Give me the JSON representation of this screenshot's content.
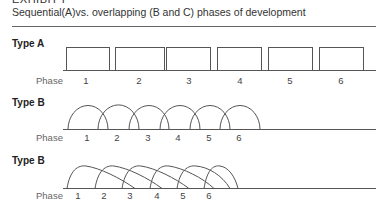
{
  "header": {
    "exhibit": "EXHIBIT I",
    "subtitle": "Sequential(A)vs. overlapping (B and C) phases of development"
  },
  "diagrams": [
    {
      "type_label": "Type A",
      "phase_label": "Phase",
      "phases": [
        "1",
        "2",
        "3",
        "4",
        "5",
        "6"
      ],
      "shape": "rectangles"
    },
    {
      "type_label": "Type B",
      "phase_label": "Phase",
      "phases": [
        "1",
        "2",
        "3",
        "4",
        "5",
        "6"
      ],
      "shape": "overlapping-arcs"
    },
    {
      "type_label": "Type B",
      "phase_label": "Phase",
      "phases": [
        "1",
        "2",
        "3",
        "4",
        "5",
        "6"
      ],
      "shape": "skewed-overlapping-arcs"
    }
  ],
  "colors": {
    "line": "#555555",
    "text": "#222222"
  }
}
